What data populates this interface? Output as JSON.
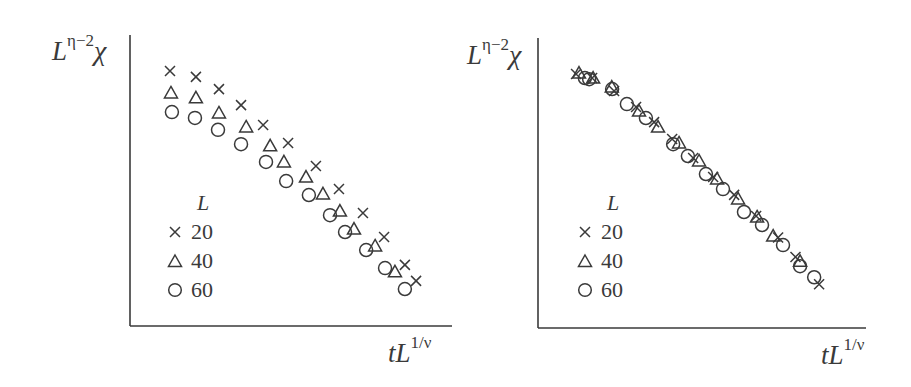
{
  "chart_data": [
    {
      "type": "scatter",
      "title": "",
      "panel": "left (unscaled)",
      "xlabel": "tL^{1/ν}",
      "ylabel": "L^{η−2}χ",
      "xlim": [
        0,
        1
      ],
      "ylim": [
        0,
        1
      ],
      "grid": false,
      "ticks": false,
      "legend": {
        "title": "L",
        "position": "lower-left",
        "entries": [
          "20",
          "40",
          "60"
        ]
      },
      "series": [
        {
          "name": "20",
          "marker": "x",
          "x": [
            0.125,
            0.206,
            0.278,
            0.347,
            0.416,
            0.494,
            0.581,
            0.653,
            0.728,
            0.794,
            0.859,
            0.894
          ],
          "y": [
            0.876,
            0.856,
            0.814,
            0.759,
            0.691,
            0.629,
            0.55,
            0.471,
            0.388,
            0.306,
            0.21,
            0.155
          ]
        },
        {
          "name": "40",
          "marker": "triangle",
          "x": [
            0.128,
            0.206,
            0.278,
            0.363,
            0.438,
            0.481,
            0.55,
            0.603,
            0.656,
            0.7,
            0.766,
            0.828
          ],
          "y": [
            0.801,
            0.784,
            0.732,
            0.684,
            0.619,
            0.564,
            0.512,
            0.454,
            0.395,
            0.333,
            0.275,
            0.186
          ]
        },
        {
          "name": "60",
          "marker": "circle",
          "x": [
            0.131,
            0.203,
            0.275,
            0.347,
            0.425,
            0.488,
            0.559,
            0.625,
            0.672,
            0.738,
            0.797,
            0.859
          ],
          "y": [
            0.735,
            0.715,
            0.674,
            0.625,
            0.564,
            0.498,
            0.45,
            0.381,
            0.323,
            0.261,
            0.199,
            0.127
          ]
        }
      ]
    },
    {
      "type": "scatter",
      "title": "",
      "panel": "right (scaled / data collapse)",
      "xlabel": "tL^{1/ν}",
      "ylabel": "L^{η−2}χ",
      "xlim": [
        0,
        1
      ],
      "ylim": [
        0,
        1
      ],
      "grid": false,
      "ticks": false,
      "legend": {
        "title": "L",
        "position": "lower-left",
        "entries": [
          "20",
          "40",
          "60"
        ]
      },
      "series": [
        {
          "name": "20",
          "marker": "x",
          "x": [
            0.116,
            0.165,
            0.232,
            0.299,
            0.354,
            0.409,
            0.473,
            0.534,
            0.598,
            0.665,
            0.732,
            0.785,
            0.857
          ],
          "y": [
            0.876,
            0.862,
            0.817,
            0.762,
            0.71,
            0.652,
            0.586,
            0.521,
            0.459,
            0.386,
            0.312,
            0.245,
            0.151
          ]
        },
        {
          "name": "40",
          "marker": "triangle",
          "x": [
            0.125,
            0.168,
            0.225,
            0.308,
            0.366,
            0.43,
            0.491,
            0.546,
            0.61,
            0.668,
            0.717,
            0.799
          ],
          "y": [
            0.879,
            0.862,
            0.831,
            0.748,
            0.693,
            0.638,
            0.576,
            0.514,
            0.445,
            0.383,
            0.317,
            0.23
          ]
        },
        {
          "name": "60",
          "marker": "circle",
          "x": [
            0.143,
            0.156,
            0.226,
            0.271,
            0.329,
            0.412,
            0.457,
            0.512,
            0.564,
            0.628,
            0.683,
            0.747,
            0.799,
            0.842
          ],
          "y": [
            0.862,
            0.858,
            0.824,
            0.772,
            0.724,
            0.634,
            0.593,
            0.531,
            0.479,
            0.4,
            0.355,
            0.286,
            0.213,
            0.175
          ]
        }
      ]
    }
  ],
  "panels": {
    "left": {
      "ylabel_base": "L",
      "ylabel_sup": "η−2",
      "ylabel_tail": "χ",
      "xlabel_base": "tL",
      "xlabel_sup": "1/ν"
    },
    "right": {
      "ylabel_base": "L",
      "ylabel_sup": "η−2",
      "ylabel_tail": "χ",
      "xlabel_base": "tL",
      "xlabel_sup": "1/ν"
    }
  },
  "legend": {
    "title": "L",
    "items": [
      {
        "marker": "x-icon",
        "label": "20"
      },
      {
        "marker": "triangle-icon",
        "label": "40"
      },
      {
        "marker": "circle-icon",
        "label": "60"
      }
    ]
  },
  "style": {
    "ink": "#3a3a3a",
    "background": "#ffffff"
  }
}
